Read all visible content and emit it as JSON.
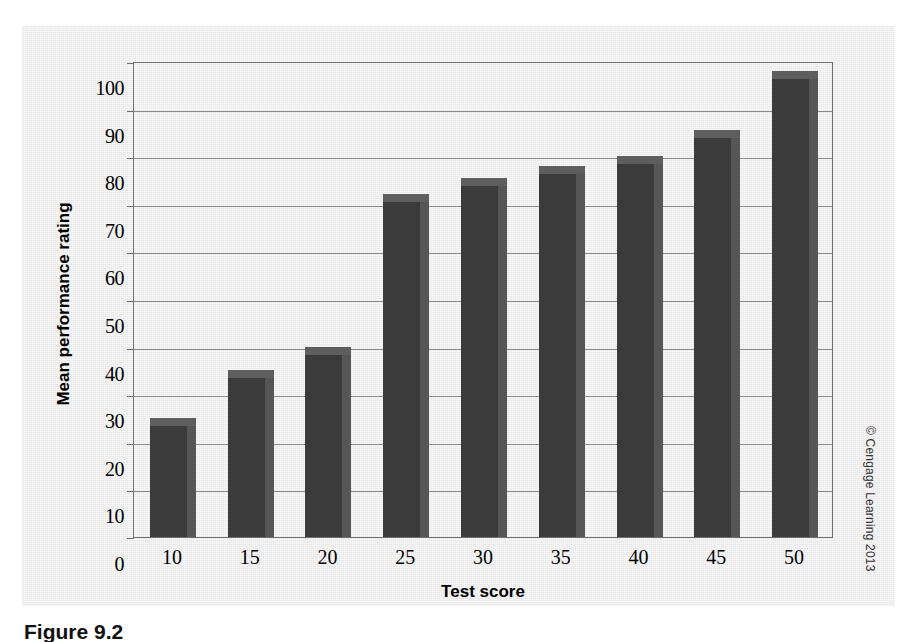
{
  "chart_data": {
    "type": "bar",
    "title": "",
    "xlabel": "Test score",
    "ylabel": "Mean performance rating",
    "categories": [
      "10",
      "15",
      "20",
      "25",
      "30",
      "35",
      "40",
      "45",
      "50"
    ],
    "values": [
      25,
      35,
      40,
      72,
      75.5,
      78,
      80,
      85.5,
      98
    ],
    "ylim": [
      0,
      100
    ],
    "ytick_labels": [
      "0",
      "10",
      "20",
      "30",
      "40",
      "50",
      "60",
      "70",
      "80",
      "90",
      "100"
    ],
    "ytick_values": [
      0,
      10,
      20,
      30,
      40,
      50,
      60,
      70,
      80,
      90,
      100
    ],
    "grid": "horizontal",
    "legend": "none",
    "series": [
      {
        "name": "Mean performance rating",
        "values": [
          25,
          35,
          40,
          72,
          75.5,
          78,
          80,
          85.5,
          98
        ]
      }
    ]
  },
  "colors": {
    "bar_front": "#3b3b3b",
    "bar_top": "#5e5e5e",
    "bar_side": "#565656",
    "panel_background": "#e8e8e8",
    "gridline": "#8a8a8a",
    "axis": "#6f6f6f",
    "text": "#000000"
  },
  "credit": {
    "copyright_text": "© Cengage Learning 2013"
  },
  "caption": {
    "label": "Figure 9.2"
  }
}
